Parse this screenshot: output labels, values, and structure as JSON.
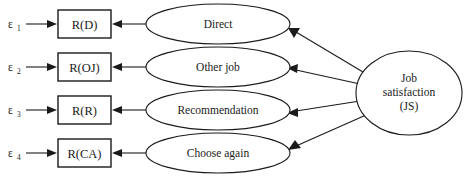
{
  "diagram": {
    "type": "path-diagram",
    "title": "",
    "errors": [
      {
        "id": "e1",
        "symbol": "ε",
        "subscript": "1"
      },
      {
        "id": "e2",
        "symbol": "ε",
        "subscript": "2"
      },
      {
        "id": "e3",
        "symbol": "ε",
        "subscript": "3"
      },
      {
        "id": "e4",
        "symbol": "ε",
        "subscript": "4"
      }
    ],
    "indicators": [
      {
        "id": "rd",
        "label": "R(D)"
      },
      {
        "id": "roj",
        "label": "R(OJ)"
      },
      {
        "id": "rr",
        "label": "R(R)"
      },
      {
        "id": "rca",
        "label": "R(CA)"
      }
    ],
    "constructs": [
      {
        "id": "direct",
        "label": "Direct"
      },
      {
        "id": "other-job",
        "label": "Other job"
      },
      {
        "id": "recommendation",
        "label": "Recommendation"
      },
      {
        "id": "choose-again",
        "label": "Choose again"
      }
    ],
    "latent": {
      "id": "job-satisfaction",
      "line1": "Job",
      "line2": "satisfaction",
      "line3": "(JS)"
    },
    "colors": {
      "stroke": "#1a1a1a",
      "fill": "#ffffff",
      "background": "#ffffff"
    }
  }
}
